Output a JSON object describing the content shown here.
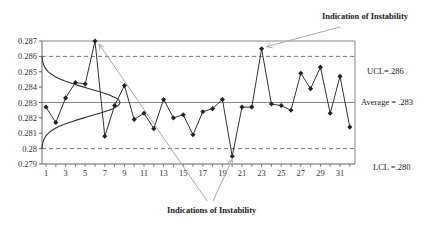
{
  "chart_data": {
    "type": "line",
    "title": "",
    "xlabel": "",
    "ylabel": "",
    "ylim": [
      0.279,
      0.287
    ],
    "yticks": [
      "0.279",
      "0.28",
      "0.281",
      "0.282",
      "0.283",
      "0.284",
      "0.285",
      "0.286",
      "0.287"
    ],
    "xticks": [
      "1",
      "3",
      "5",
      "7",
      "9",
      "11",
      "13",
      "15",
      "17",
      "19",
      "21",
      "23",
      "25",
      "27",
      "29",
      "31"
    ],
    "x": [
      1,
      2,
      3,
      4,
      5,
      6,
      7,
      8,
      9,
      10,
      11,
      12,
      13,
      14,
      15,
      16,
      17,
      18,
      19,
      20,
      21,
      22,
      23,
      24,
      25,
      26,
      27,
      28,
      29,
      30,
      31,
      32
    ],
    "series": [
      {
        "name": "Measurements",
        "values": [
          0.2827,
          0.2817,
          0.2833,
          0.2843,
          0.2842,
          0.287,
          0.2808,
          0.2828,
          0.2841,
          0.2819,
          0.2823,
          0.2813,
          0.2832,
          0.282,
          0.2822,
          0.2809,
          0.2824,
          0.2826,
          0.2832,
          0.2795,
          0.2827,
          0.2827,
          0.2865,
          0.2829,
          0.2828,
          0.2825,
          0.2849,
          0.2839,
          0.2853,
          0.2823,
          0.2847,
          0.2814
        ]
      }
    ],
    "reference_lines": [
      {
        "name": "UCL",
        "value": 0.286,
        "style": "dashed",
        "label": "UCL=.286"
      },
      {
        "name": "Average",
        "value": 0.283,
        "style": "solid",
        "label": "Average = .283"
      },
      {
        "name": "LCL",
        "value": 0.28,
        "style": "dashed",
        "label": "LCL =.280"
      }
    ],
    "annotations": [
      {
        "text": "Indication of Instability",
        "points_to": [
          23
        ]
      },
      {
        "text": "Indications of Instability",
        "points_to": [
          6,
          20
        ]
      }
    ],
    "overlay": "normal distribution curve spanning LCL to UCL along the y-axis",
    "grid": false,
    "legend": "none"
  },
  "labels": {
    "ucl": "UCL=.286",
    "average": "Average = .283",
    "lcl": "LCL =.280",
    "top_annotation": "Indication of Instability",
    "bottom_annotation": "Indications of Instability"
  },
  "colors": {
    "line": "#333333",
    "reference": "#777777",
    "arrow": "#aaaaaa",
    "text": "#222222"
  }
}
